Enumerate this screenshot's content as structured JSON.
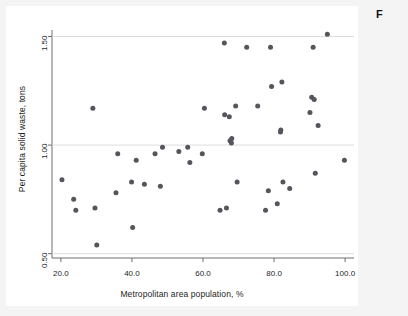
{
  "figure": {
    "caption_fragment": "F",
    "background_color": "#f4f4f4",
    "plot_background_color": "#ffffff"
  },
  "chart_data": {
    "type": "scatter",
    "title": "",
    "subtitle": "",
    "xlabel": "Metropolitan area population, %",
    "ylabel": "Per capita solid waste, tons",
    "xlim": [
      17.5,
      102.5
    ],
    "ylim": [
      0.48,
      1.53
    ],
    "xticks": [
      20,
      40,
      60,
      80,
      100
    ],
    "xticklabels": [
      "20.0",
      "40.0",
      "60.0",
      "80.0",
      "100.0"
    ],
    "yticks": [
      0.5,
      1.0,
      1.5
    ],
    "yticklabels": [
      "0.50",
      "1.00",
      "1.50"
    ],
    "grid": true,
    "gridlines_horizontal_at": [
      0.5,
      1.0,
      1.5
    ],
    "legend": null,
    "legend_position": "none",
    "marker": {
      "shape": "circle",
      "color": "#55555c",
      "size_px": 5
    },
    "series": [
      {
        "name": "Metropolitan areas",
        "color": "#55555c",
        "points": [
          {
            "x": 20.3,
            "y": 0.84
          },
          {
            "x": 23.6,
            "y": 0.75
          },
          {
            "x": 24.2,
            "y": 0.7
          },
          {
            "x": 29.0,
            "y": 1.17
          },
          {
            "x": 29.6,
            "y": 0.71
          },
          {
            "x": 30.1,
            "y": 0.54
          },
          {
            "x": 35.5,
            "y": 0.78
          },
          {
            "x": 36.0,
            "y": 0.96
          },
          {
            "x": 39.9,
            "y": 0.83
          },
          {
            "x": 40.2,
            "y": 0.62
          },
          {
            "x": 41.2,
            "y": 0.93
          },
          {
            "x": 43.5,
            "y": 0.82
          },
          {
            "x": 46.5,
            "y": 0.96
          },
          {
            "x": 48.0,
            "y": 0.81
          },
          {
            "x": 48.6,
            "y": 0.99
          },
          {
            "x": 53.2,
            "y": 0.97
          },
          {
            "x": 55.7,
            "y": 0.99
          },
          {
            "x": 56.3,
            "y": 0.92
          },
          {
            "x": 59.8,
            "y": 0.96
          },
          {
            "x": 60.4,
            "y": 1.17
          },
          {
            "x": 64.8,
            "y": 0.7
          },
          {
            "x": 66.0,
            "y": 1.47
          },
          {
            "x": 66.1,
            "y": 1.14
          },
          {
            "x": 66.6,
            "y": 0.71
          },
          {
            "x": 67.4,
            "y": 1.13
          },
          {
            "x": 67.6,
            "y": 1.02
          },
          {
            "x": 68.0,
            "y": 1.01
          },
          {
            "x": 68.1,
            "y": 1.03
          },
          {
            "x": 69.2,
            "y": 1.18
          },
          {
            "x": 69.6,
            "y": 0.83
          },
          {
            "x": 72.3,
            "y": 1.45
          },
          {
            "x": 75.4,
            "y": 1.18
          },
          {
            "x": 77.6,
            "y": 0.7
          },
          {
            "x": 78.4,
            "y": 0.79
          },
          {
            "x": 79.0,
            "y": 1.45
          },
          {
            "x": 79.3,
            "y": 1.27
          },
          {
            "x": 80.9,
            "y": 0.73
          },
          {
            "x": 81.8,
            "y": 1.06
          },
          {
            "x": 81.9,
            "y": 1.07
          },
          {
            "x": 82.2,
            "y": 1.29
          },
          {
            "x": 82.5,
            "y": 0.83
          },
          {
            "x": 84.4,
            "y": 0.8
          },
          {
            "x": 90.1,
            "y": 1.15
          },
          {
            "x": 90.6,
            "y": 1.22
          },
          {
            "x": 91.0,
            "y": 1.45
          },
          {
            "x": 91.3,
            "y": 1.21
          },
          {
            "x": 91.6,
            "y": 0.87
          },
          {
            "x": 92.4,
            "y": 1.09
          },
          {
            "x": 95.0,
            "y": 1.51
          },
          {
            "x": 99.8,
            "y": 0.93
          }
        ]
      }
    ]
  }
}
